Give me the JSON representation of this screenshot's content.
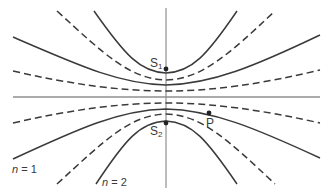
{
  "diagram": {
    "labels": {
      "s1_main": "S",
      "s1_sub": "1",
      "s2_main": "S",
      "s2_sub": "2",
      "p": "P",
      "n1_var": "n",
      "n1_rest": " = 1",
      "n2_var": "n",
      "n2_rest": " = 2"
    },
    "points": [
      {
        "name": "S1",
        "x": 166,
        "y": 69
      },
      {
        "name": "S2",
        "x": 166,
        "y": 123
      },
      {
        "name": "P",
        "x": 209,
        "y": 113
      }
    ],
    "line_styles": {
      "solid": "antinodal lines (constructive)",
      "dashed": "nodal lines (destructive)"
    },
    "colors": {
      "line": "#3a3a3a",
      "axis": "#8a8a8a",
      "background": "#ffffff"
    }
  }
}
